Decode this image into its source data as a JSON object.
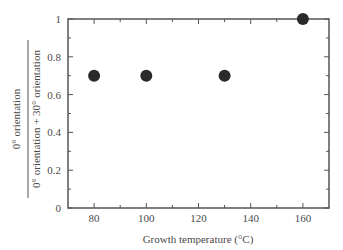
{
  "chart_data": {
    "type": "scatter",
    "title": "",
    "xlabel": "Growth temperature (°C)",
    "ylabel": {
      "numerator": "0° orientation",
      "denominator": "0° orientation + 30° orientation"
    },
    "xlim": [
      70,
      170
    ],
    "ylim": [
      0,
      1
    ],
    "x_ticks": [
      80,
      100,
      120,
      140,
      160
    ],
    "x_minor_ticks": [
      90,
      110,
      130,
      150
    ],
    "y_ticks": [
      0,
      0.2,
      0.4,
      0.6,
      0.8,
      1
    ],
    "y_tick_labels": [
      "0",
      "0.2",
      "0.4",
      "0.6",
      "0.8",
      "1"
    ],
    "y_minor_ticks": [
      0.1,
      0.3,
      0.5,
      0.7,
      0.9
    ],
    "grid": false,
    "legend": null,
    "series": [
      {
        "name": "data",
        "marker": "filled-circle",
        "color": "#2a2a2a",
        "points": [
          {
            "x": 80,
            "y": 0.7
          },
          {
            "x": 100,
            "y": 0.7
          },
          {
            "x": 130,
            "y": 0.7
          },
          {
            "x": 160,
            "y": 1.0
          }
        ]
      }
    ]
  },
  "colors": {
    "frame": "#555555",
    "marker": "#2a2a2a",
    "text": "#4a4a4a"
  }
}
